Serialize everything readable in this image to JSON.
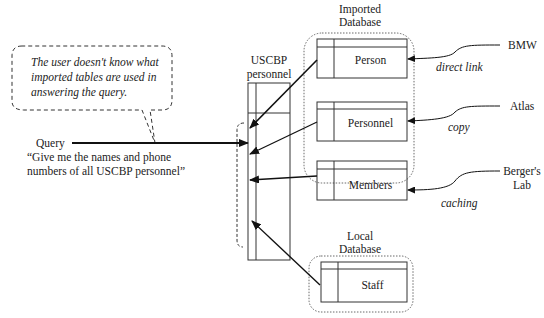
{
  "callout": {
    "lines": [
      "The user doesn't know what",
      "imported tables are used in",
      "answering the query."
    ]
  },
  "query": {
    "label": "Query",
    "text_line1": "“Give me the names and phone",
    "text_line2": "numbers of all USCBP personnel”"
  },
  "view": {
    "title_line1": "USCBP",
    "title_line2": "personnel"
  },
  "imported_database": {
    "title_line1": "Imported",
    "title_line2": "Database",
    "tables": [
      {
        "name": "Person",
        "source": "BMW",
        "method": "direct link"
      },
      {
        "name": "Personnel",
        "source": "Atlas",
        "method": "copy"
      },
      {
        "name": "Members",
        "source_line1": "Berger's",
        "source_line2": "Lab",
        "method": "caching"
      }
    ]
  },
  "local_database": {
    "title_line1": "Local",
    "title_line2": "Database",
    "tables": [
      {
        "name": "Staff"
      }
    ]
  }
}
